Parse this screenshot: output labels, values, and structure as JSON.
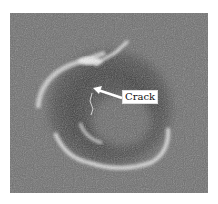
{
  "figure": {
    "annotation": {
      "label": "Crack",
      "arrow_direction": "left"
    },
    "colors": {
      "background": "#6e6e6e",
      "rim": "#e6e6e6",
      "pit": "#3c3c3c",
      "label_bg": "#ffffff"
    }
  }
}
